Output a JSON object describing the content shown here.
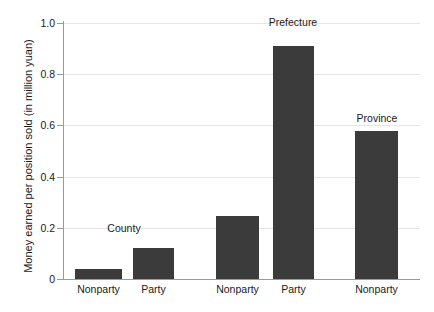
{
  "chart_data": {
    "type": "bar",
    "title": "",
    "subtitle": "",
    "xlabel": "",
    "ylabel": "Money earned  per position sold (in million yuan)",
    "ylim": [
      0,
      1.0
    ],
    "xlim": [
      0,
      1
    ],
    "grid": true,
    "legend": null,
    "categories": [
      "Nonparty",
      "Party",
      "Nonparty",
      "Party",
      "Nonparty"
    ],
    "values": [
      0.04,
      0.12,
      0.245,
      0.91,
      0.58
    ],
    "bar_color": "#3b3b3b",
    "groups": [
      {
        "label": "County",
        "members": [
          "Nonparty",
          "Party"
        ]
      },
      {
        "label": "Prefecture",
        "members": [
          "Nonparty",
          "Party"
        ]
      },
      {
        "label": "Province",
        "members": [
          "Nonparty"
        ]
      }
    ],
    "annotations": [
      {
        "text": "County",
        "x_px": 124,
        "y_px": 222
      },
      {
        "text": "Prefecture",
        "x_px": 293,
        "y_px": 16
      },
      {
        "text": "Province",
        "x_px": 377,
        "y_px": 112
      }
    ],
    "yticks": [
      {
        "value": 0,
        "label": "0"
      },
      {
        "value": 0.2,
        "label": "0.2"
      },
      {
        "value": 0.4,
        "label": "0.4"
      },
      {
        "value": 0.6,
        "label": "0.6"
      },
      {
        "value": 0.8,
        "label": "0.8"
      },
      {
        "value": 1.0,
        "label": "1.0"
      }
    ],
    "bars": [
      {
        "category": "Nonparty",
        "group": "County",
        "value": 0.04,
        "x_px": 75,
        "width_px": 47
      },
      {
        "category": "Party",
        "group": "County",
        "value": 0.12,
        "x_px": 133,
        "width_px": 41
      },
      {
        "category": "Nonparty",
        "group": "Prefecture",
        "value": 0.245,
        "x_px": 216,
        "width_px": 43
      },
      {
        "category": "Party",
        "group": "Prefecture",
        "value": 0.91,
        "x_px": 273,
        "width_px": 41
      },
      {
        "category": "Nonparty",
        "group": "Province",
        "value": 0.58,
        "x_px": 355,
        "width_px": 43
      }
    ]
  }
}
